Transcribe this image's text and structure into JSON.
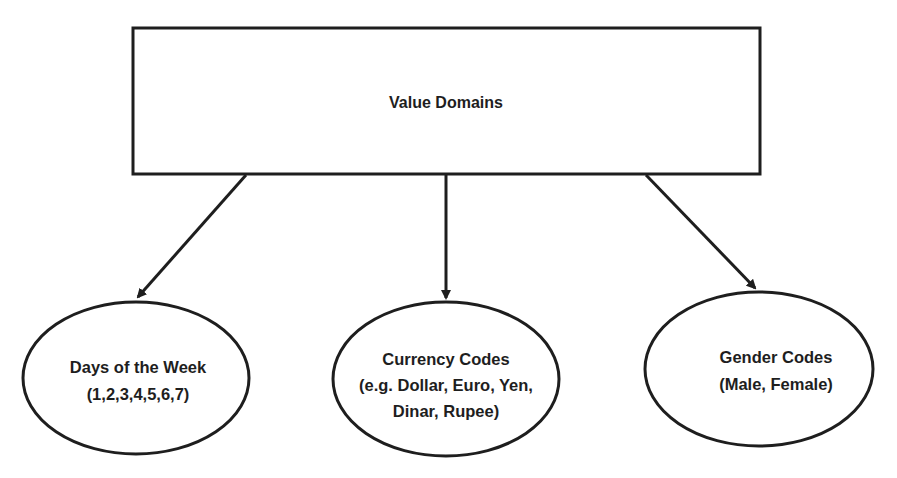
{
  "diagram": {
    "root": {
      "label": "Value Domains"
    },
    "children": [
      {
        "id": "days",
        "lines": [
          "Days of the Week",
          "(1,2,3,4,5,6,7)"
        ]
      },
      {
        "id": "currency",
        "lines": [
          "Currency Codes",
          "(e.g. Dollar, Euro, Yen,",
          "Dinar, Rupee)"
        ]
      },
      {
        "id": "gender",
        "lines": [
          "Gender Codes",
          "(Male, Female)"
        ]
      }
    ],
    "edges": [
      {
        "from": "root",
        "to": "days"
      },
      {
        "from": "root",
        "to": "currency"
      },
      {
        "from": "root",
        "to": "gender"
      }
    ],
    "colors": {
      "stroke": "#1e1e1e",
      "text": "#1e1e1e",
      "background": "#ffffff"
    }
  }
}
